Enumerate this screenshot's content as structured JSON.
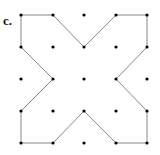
{
  "figure": {
    "label": "c.",
    "grid": {
      "cols": 5,
      "rows": 5,
      "x": [
        21,
        53,
        84,
        116,
        147
      ],
      "y": [
        15,
        47,
        79,
        111,
        143
      ]
    },
    "polygon_points": [
      [
        0,
        0
      ],
      [
        1,
        0
      ],
      [
        2,
        1
      ],
      [
        3,
        0
      ],
      [
        4,
        0
      ],
      [
        4,
        1
      ],
      [
        3,
        2
      ],
      [
        4,
        3
      ],
      [
        4,
        4
      ],
      [
        3,
        4
      ],
      [
        2,
        3
      ],
      [
        1,
        4
      ],
      [
        0,
        4
      ],
      [
        0,
        3
      ],
      [
        1,
        2
      ],
      [
        0,
        1
      ]
    ],
    "line_color": "#888888",
    "dot_color": "#000000"
  }
}
